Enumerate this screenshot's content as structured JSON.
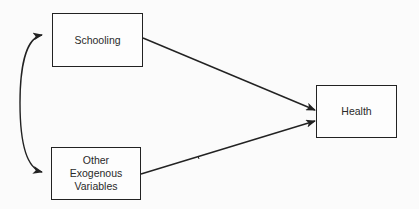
{
  "diagram": {
    "nodes": [
      {
        "id": "schooling",
        "label": "Schooling"
      },
      {
        "id": "other",
        "lines": [
          "Other",
          "Exogenous",
          "Variables"
        ]
      },
      {
        "id": "health",
        "label": "Health"
      }
    ],
    "edges": [
      {
        "from": "schooling",
        "to": "health",
        "type": "directed"
      },
      {
        "from": "other",
        "to": "health",
        "type": "directed"
      },
      {
        "from": "schooling",
        "to": "other",
        "type": "bidirectional-curved"
      }
    ],
    "colors": {
      "line": "#222222",
      "background": "#fbfbfb"
    }
  }
}
